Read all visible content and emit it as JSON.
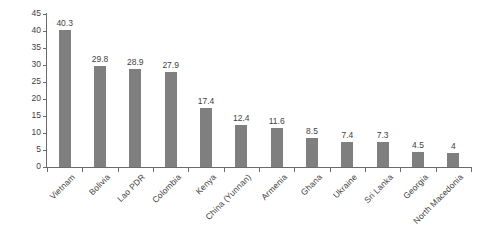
{
  "chart_data": {
    "type": "bar",
    "title": "",
    "xlabel": "",
    "ylabel": "Share of respondents (%)",
    "ylim": [
      0,
      45
    ],
    "ytick_step": 5,
    "yticks": [
      "45",
      "40",
      "35",
      "30",
      "25",
      "20",
      "15",
      "10",
      "5",
      "0"
    ],
    "grid": false,
    "legend": null,
    "bar_color": "#7f7f7f",
    "axis_color": "#6b6b6b",
    "text_color": "#3f3f3f",
    "background": "#ffffff",
    "categories": [
      "Vietnam",
      "Bolivia",
      "Lao PDR",
      "Colombia",
      "Kenya",
      "China (Yunnan)",
      "Armenia",
      "Ghana",
      "Ukraine",
      "Sri Lanka",
      "Georgia",
      "North Macedonia"
    ],
    "values": [
      40.3,
      29.8,
      28.9,
      27.9,
      17.4,
      12.4,
      11.6,
      8.5,
      7.4,
      7.3,
      4.5,
      4
    ],
    "value_labels": [
      "40.3",
      "29.8",
      "28.9",
      "27.9",
      "17.4",
      "12.4",
      "11.6",
      "8.5",
      "7.4",
      "7.3",
      "4.5",
      "4"
    ]
  }
}
